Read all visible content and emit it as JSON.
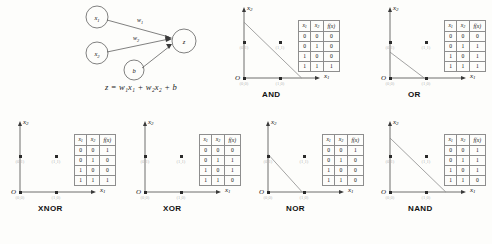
{
  "diagram": {
    "nodes": [
      {
        "id": "x1",
        "label": "x",
        "sub": "1"
      },
      {
        "id": "x2",
        "label": "x",
        "sub": "2"
      },
      {
        "id": "b",
        "label": "b",
        "sub": ""
      },
      {
        "id": "z",
        "label": "z",
        "sub": ""
      }
    ],
    "edges": [
      {
        "from": "x1",
        "to": "z",
        "label": "w",
        "sub": "1"
      },
      {
        "from": "x2",
        "to": "z",
        "label": "w",
        "sub": "2"
      },
      {
        "from": "b",
        "to": "z",
        "label": "",
        "sub": ""
      }
    ],
    "formula": "z = w₁x₁ + w₂x₂ + b"
  },
  "table_header": {
    "x1": "x",
    "x1sub": "1",
    "x2": "x",
    "x2sub": "2",
    "fx": "f(x)"
  },
  "axes": {
    "x": "x",
    "xsub": "1",
    "y": "x",
    "ysub": "2",
    "origin": "O"
  },
  "chart_data": [
    {
      "type": "scatter",
      "title": "AND",
      "xlabel": "x1",
      "ylabel": "x2",
      "xlim": [
        0,
        1.6
      ],
      "ylim": [
        0,
        1.6
      ],
      "grid": false,
      "points": [
        {
          "x": 0,
          "y": 0,
          "label": "(0,0)",
          "f": 0
        },
        {
          "x": 1,
          "y": 0,
          "label": "(1,0)",
          "f": 0
        },
        {
          "x": 0,
          "y": 1,
          "label": "(0,1)",
          "f": 0
        },
        {
          "x": 1,
          "y": 1,
          "label": "(1,1)",
          "f": 1
        }
      ],
      "decision_line": {
        "x_intercept": 1.6,
        "y_intercept": 1.55,
        "present": true
      },
      "truth_table": {
        "columns": [
          "x1",
          "x2",
          "f(x)"
        ],
        "rows": [
          [
            0,
            0,
            0
          ],
          [
            0,
            1,
            0
          ],
          [
            1,
            0,
            0
          ],
          [
            1,
            1,
            1
          ]
        ]
      }
    },
    {
      "type": "scatter",
      "title": "OR",
      "xlabel": "x1",
      "ylabel": "x2",
      "xlim": [
        0,
        1.6
      ],
      "ylim": [
        0,
        1.6
      ],
      "grid": false,
      "points": [
        {
          "x": 0,
          "y": 0,
          "label": "(0,0)",
          "f": 0
        },
        {
          "x": 1,
          "y": 0,
          "label": "(1,0)",
          "f": 1
        },
        {
          "x": 0,
          "y": 1,
          "label": "(0,1)",
          "f": 1
        },
        {
          "x": 1,
          "y": 1,
          "label": "(1,1)",
          "f": 1
        }
      ],
      "decision_line": {
        "x_intercept": 0.95,
        "y_intercept": 0.72,
        "present": true
      },
      "truth_table": {
        "columns": [
          "x1",
          "x2",
          "f(x)"
        ],
        "rows": [
          [
            0,
            0,
            0
          ],
          [
            0,
            1,
            1
          ],
          [
            1,
            0,
            1
          ],
          [
            1,
            1,
            1
          ]
        ]
      }
    },
    {
      "type": "scatter",
      "title": "XNOR",
      "xlabel": "x1",
      "ylabel": "x2",
      "xlim": [
        0,
        1.6
      ],
      "ylim": [
        0,
        1.6
      ],
      "grid": false,
      "points": [
        {
          "x": 0,
          "y": 0,
          "label": "(0,0)",
          "f": 1
        },
        {
          "x": 1,
          "y": 0,
          "label": "(1,0)",
          "f": 0
        },
        {
          "x": 0,
          "y": 1,
          "label": "(0,1)",
          "f": 0
        },
        {
          "x": 1,
          "y": 1,
          "label": "(1,1)",
          "f": 1
        }
      ],
      "decision_line": {
        "present": false
      },
      "truth_table": {
        "columns": [
          "x1",
          "x2",
          "f(x)"
        ],
        "rows": [
          [
            0,
            0,
            1
          ],
          [
            0,
            1,
            0
          ],
          [
            1,
            0,
            0
          ],
          [
            1,
            1,
            1
          ]
        ]
      }
    },
    {
      "type": "scatter",
      "title": "XOR",
      "xlabel": "x1",
      "ylabel": "x2",
      "xlim": [
        0,
        1.6
      ],
      "ylim": [
        0,
        1.6
      ],
      "grid": false,
      "points": [
        {
          "x": 0,
          "y": 0,
          "label": "(0,0)",
          "f": 0
        },
        {
          "x": 1,
          "y": 0,
          "label": "(1,0)",
          "f": 1
        },
        {
          "x": 0,
          "y": 1,
          "label": "(0,1)",
          "f": 1
        },
        {
          "x": 1,
          "y": 1,
          "label": "(1,1)",
          "f": 0
        }
      ],
      "decision_line": {
        "present": false
      },
      "truth_table": {
        "columns": [
          "x1",
          "x2",
          "f(x)"
        ],
        "rows": [
          [
            0,
            0,
            0
          ],
          [
            0,
            1,
            1
          ],
          [
            1,
            0,
            1
          ],
          [
            1,
            1,
            0
          ]
        ]
      }
    },
    {
      "type": "scatter",
      "title": "NOR",
      "xlabel": "x1",
      "ylabel": "x2",
      "xlim": [
        0,
        1.6
      ],
      "ylim": [
        0,
        1.6
      ],
      "grid": false,
      "points": [
        {
          "x": 0,
          "y": 0,
          "label": "(0,0)",
          "f": 1
        },
        {
          "x": 1,
          "y": 0,
          "label": "(1,0)",
          "f": 0
        },
        {
          "x": 0,
          "y": 1,
          "label": "(0,1)",
          "f": 0
        },
        {
          "x": 1,
          "y": 1,
          "label": "(1,1)",
          "f": 0
        }
      ],
      "decision_line": {
        "x_intercept": 0.95,
        "y_intercept": 1.05,
        "present": true
      },
      "truth_table": {
        "columns": [
          "x1",
          "x2",
          "f(x)"
        ],
        "rows": [
          [
            0,
            0,
            1
          ],
          [
            0,
            1,
            0
          ],
          [
            1,
            0,
            0
          ],
          [
            1,
            1,
            0
          ]
        ]
      }
    },
    {
      "type": "scatter",
      "title": "NAND",
      "xlabel": "x1",
      "ylabel": "x2",
      "xlim": [
        0,
        1.6
      ],
      "ylim": [
        0,
        1.6
      ],
      "grid": false,
      "points": [
        {
          "x": 0,
          "y": 0,
          "label": "(0,0)",
          "f": 1
        },
        {
          "x": 1,
          "y": 0,
          "label": "(1,0)",
          "f": 1
        },
        {
          "x": 0,
          "y": 1,
          "label": "(0,1)",
          "f": 1
        },
        {
          "x": 1,
          "y": 1,
          "label": "(1,1)",
          "f": 0
        }
      ],
      "decision_line": {
        "x_intercept": 1.55,
        "y_intercept": 1.5,
        "present": true
      },
      "truth_table": {
        "columns": [
          "x1",
          "x2",
          "f(x)"
        ],
        "rows": [
          [
            0,
            0,
            1
          ],
          [
            0,
            1,
            1
          ],
          [
            1,
            0,
            1
          ],
          [
            1,
            1,
            0
          ]
        ]
      }
    }
  ]
}
